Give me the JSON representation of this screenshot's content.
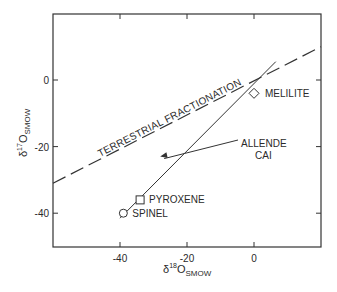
{
  "chart_data": {
    "type": "line",
    "title": "",
    "xlabel": "δ18O SMOW",
    "ylabel": "δ17O SMOW",
    "xlabel_parts": {
      "delta": "δ",
      "sup": "18",
      "base": "O",
      "sub": "SMOW"
    },
    "ylabel_parts": {
      "delta": "δ",
      "sup": "17",
      "base": "O",
      "sub": "SMOW"
    },
    "xlim": [
      -60,
      20
    ],
    "ylim": [
      -50,
      20
    ],
    "x_ticks": [
      -40,
      -20,
      0
    ],
    "x_tick_labels": [
      "-40",
      "-20",
      "0"
    ],
    "y_ticks": [
      0,
      -20,
      -40
    ],
    "y_tick_labels": [
      "0",
      "-20",
      "-40"
    ],
    "grid": false,
    "legend": null,
    "series": [
      {
        "name": "Terrestrial Fractionation",
        "style": "dashed",
        "label": "TERRESTRIAL FRACTIONATION",
        "x": [
          -60,
          20
        ],
        "y": [
          -31,
          10
        ]
      },
      {
        "name": "Allende CAI",
        "style": "solid",
        "label_lines": [
          "ALLENDE",
          "CAI"
        ],
        "x": [
          -40,
          6.5
        ],
        "y": [
          -41.5,
          5.5
        ]
      }
    ],
    "points": [
      {
        "name": "SPINEL",
        "marker": "circle",
        "x": -39,
        "y": -40
      },
      {
        "name": "PYROXENE",
        "marker": "square",
        "x": -34,
        "y": -36
      },
      {
        "name": "MELILITE",
        "marker": "diamond",
        "x": 0,
        "y": -4
      }
    ],
    "annotations": [
      {
        "text": "TERRESTRIAL FRACTIONATION",
        "along": "Terrestrial Fractionation"
      },
      {
        "text": "ALLENDE CAI",
        "arrow_to": [
          -28,
          -23
        ]
      }
    ]
  }
}
